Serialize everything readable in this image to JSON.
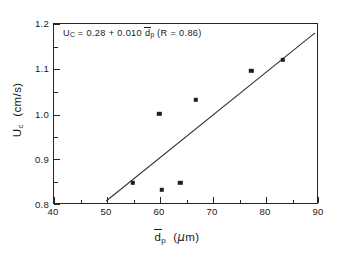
{
  "chart_data": {
    "type": "scatter",
    "title": "",
    "xlabel": "d̄p  (μ m)",
    "ylabel": "Uc  (cm/s)",
    "xlim": [
      40,
      90
    ],
    "ylim": [
      0.8,
      1.2
    ],
    "grid": false,
    "legend": "none",
    "x_ticks": [
      40,
      50,
      60,
      70,
      80,
      90
    ],
    "x_tick_labels": [
      "40",
      "50",
      "60",
      "70",
      "80",
      "90"
    ],
    "x_minor_ticks": [
      45,
      55,
      65,
      75,
      85
    ],
    "y_ticks": [
      0.8,
      0.9,
      1.0,
      1.1,
      1.2
    ],
    "y_tick_labels": [
      "0.8",
      "0.9",
      "1.0",
      "1.1",
      "1.2"
    ],
    "y_minor_ticks": [
      0.85,
      0.95,
      1.05,
      1.15
    ],
    "series": [
      {
        "name": "measured",
        "marker": "filled-square",
        "color": "#1f1f1f",
        "points": [
          {
            "x": 55.0,
            "y": 0.845
          },
          {
            "x": 60.0,
            "y": 1.0
          },
          {
            "x": 60.5,
            "y": 0.83
          },
          {
            "x": 64.0,
            "y": 0.845
          },
          {
            "x": 67.0,
            "y": 1.03
          },
          {
            "x": 77.5,
            "y": 1.095
          },
          {
            "x": 83.5,
            "y": 1.12
          }
        ]
      },
      {
        "name": "linear-fit",
        "type": "line",
        "color": "#333333",
        "intercept": 0.28,
        "slope": 0.01,
        "x_start": 50.0,
        "x_end": 90.0,
        "y_start": 0.8,
        "y_end": 1.18
      }
    ],
    "annotations": [
      {
        "name": "regression-equation",
        "text": "Uc = 0.28 + 0.010 d̄p  (R = 0.86)",
        "intercept": "0.28",
        "slope": "0.010",
        "r_value": "0.86"
      }
    ]
  },
  "annotation": {
    "u_symbol": "U",
    "u_sub": "C",
    "eq_sign": "=",
    "intercept": "0.28",
    "plus": "+",
    "slope": "0.010",
    "d_symbol": "d",
    "d_sub": "p",
    "r_open": "(R",
    "r_eq": "=",
    "r_value": "0.86)"
  },
  "axes": {
    "x_title_symbol": "d",
    "x_title_sub": "p",
    "x_title_units": "(",
    "x_title_mu": "μ",
    "x_title_m": "m)",
    "y_title_symbol": "U",
    "y_title_sub": "c",
    "y_title_units": "(cm/s)",
    "x_tick_labels": [
      "40",
      "50",
      "60",
      "70",
      "80",
      "90"
    ],
    "y_tick_labels": [
      "0.8",
      "0.9",
      "1.0",
      "1.1",
      "1.2"
    ]
  }
}
